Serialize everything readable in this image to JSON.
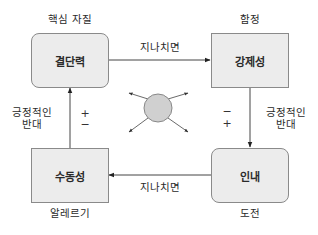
{
  "diagram": {
    "boxes": {
      "top_left": {
        "label": "결단력",
        "caption": "핵심 자질",
        "shape": "rounded"
      },
      "top_right": {
        "label": "강제성",
        "caption": "함정",
        "shape": "square"
      },
      "bottom_left": {
        "label": "수동성",
        "caption": "알레르기",
        "shape": "square"
      },
      "bottom_right": {
        "label": "인내",
        "caption": "도전",
        "shape": "rounded"
      }
    },
    "edges": {
      "top": {
        "label": "지나치면",
        "from": "결단력",
        "to": "강제성"
      },
      "bottom": {
        "label": "지나치면",
        "from": "인내",
        "to": "수동성"
      },
      "left": {
        "label_line1": "긍정적인",
        "label_line2": "반대",
        "sign_top": "+",
        "sign_bottom": "−",
        "from": "수동성",
        "to": "결단력"
      },
      "right": {
        "label_line1": "긍정적인",
        "label_line2": "반대",
        "sign_top": "−",
        "sign_bottom": "+",
        "from": "강제성",
        "to": "인내"
      }
    },
    "center": {
      "shape": "circle",
      "arrows": 4
    }
  },
  "colors": {
    "box_fill": "#ececec",
    "box_border": "#8a8a8a",
    "line": "#333333",
    "circle_fill": "#d0d0d0"
  }
}
